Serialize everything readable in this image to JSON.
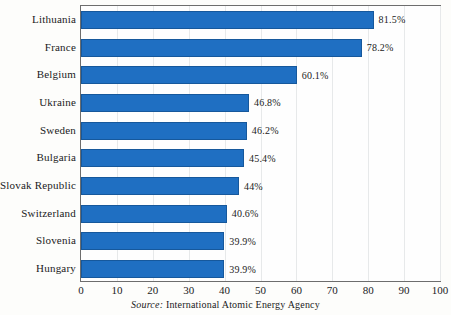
{
  "chart_data": {
    "type": "bar",
    "orientation": "horizontal",
    "title": "",
    "subtitle": "",
    "xlabel": "",
    "ylabel": "",
    "xlim": [
      0,
      100
    ],
    "xticks": [
      0,
      10,
      20,
      30,
      40,
      50,
      60,
      70,
      80,
      90,
      100
    ],
    "xtick_labels": [
      "0",
      "10",
      "20",
      "30",
      "40",
      "50",
      "60",
      "70",
      "80",
      "90",
      "100"
    ],
    "grid": true,
    "grid_axis": "x",
    "legend": false,
    "legend_position": "none",
    "value_unit": "%",
    "categories": [
      "Lithuania",
      "France",
      "Belgium",
      "Ukraine",
      "Sweden",
      "Bulgaria",
      "Slovak Republic",
      "Switzerland",
      "Slovenia",
      "Hungary"
    ],
    "values": [
      81.5,
      78.2,
      60.1,
      46.8,
      46.2,
      45.4,
      44,
      40.6,
      39.9,
      39.9
    ],
    "value_labels": [
      "81.5%",
      "78.2%",
      "60.1%",
      "46.8%",
      "46.2%",
      "45.4%",
      "44%",
      "40.6%",
      "39.9%",
      "39.9%"
    ],
    "bar_color": "#1f6fc2",
    "bar_edge_color": "#16589c",
    "grid_color": "#e7e9ea",
    "frame_color": "#6d6d6d",
    "background_color": "#fdfdfb"
  },
  "source": {
    "prefix": "Source:",
    "text": "International Atomic Energy Agency"
  }
}
